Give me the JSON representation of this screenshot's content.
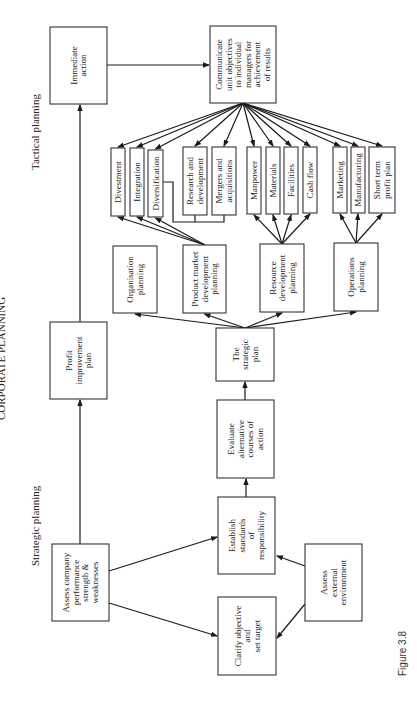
{
  "header": "CORPORATE PLANNING",
  "section_labels": {
    "tactical": "Tactical planning",
    "strategic": "Strategic planning"
  },
  "caption": "Figure 3.8",
  "boxes": {
    "immediate_action": [
      "Immediate",
      "action"
    ],
    "communicate": [
      "Communicate",
      "unit objectives",
      "to individual",
      "managers for",
      "achievement",
      "of results"
    ],
    "divestment": [
      "Divestment"
    ],
    "integration": [
      "Integration"
    ],
    "diversification": [
      "Diversification"
    ],
    "research": [
      "Research and",
      "development"
    ],
    "mergers": [
      "Mergers and",
      "acquisitions"
    ],
    "manpower": [
      "Manpower"
    ],
    "materials": [
      "Materials"
    ],
    "facilities": [
      "Facilities"
    ],
    "cash_flow": [
      "Cash flow"
    ],
    "marketing": [
      "Marketing"
    ],
    "manufacturing": [
      "Manufacturing"
    ],
    "short_term": [
      "Short term",
      "profit plan"
    ],
    "organisation": [
      "Organisation",
      "planning"
    ],
    "product_market": [
      "Product market",
      "development",
      "planning"
    ],
    "resource": [
      "Resource",
      "development",
      "planning"
    ],
    "operations": [
      "Operations",
      "planning"
    ],
    "strategic_plan": [
      "The",
      "strategic",
      "plan"
    ],
    "profit_improvement": [
      "Profit",
      "improvement",
      "plan"
    ],
    "evaluate": [
      "Evaluate",
      "alternative",
      "courses of",
      "action"
    ],
    "establish": [
      "Establish",
      "standards",
      "of",
      "responsibility"
    ],
    "assess_company": [
      "Assess company",
      "performance",
      "strength &",
      "weaknesses"
    ],
    "clarify": [
      "Clarify objective",
      "and",
      "set target"
    ],
    "assess_external": [
      "Assess",
      "external",
      "environment"
    ]
  }
}
